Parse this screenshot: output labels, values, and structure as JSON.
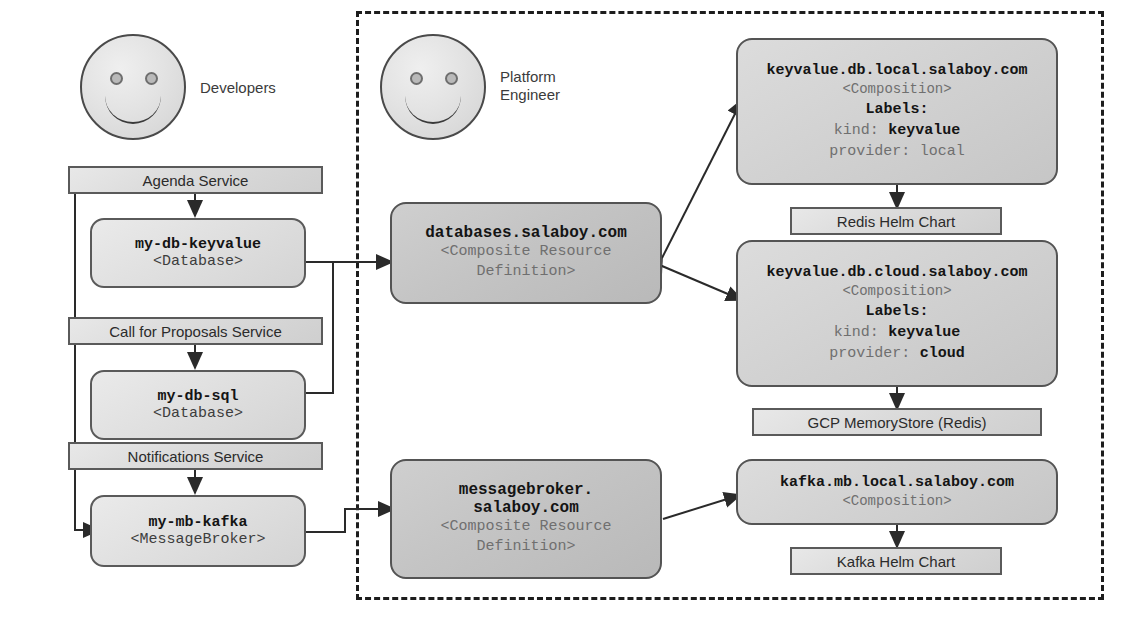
{
  "personas": [
    {
      "id": "developers",
      "label": "Developers"
    },
    {
      "id": "platform-engineer",
      "label": "Platform\nEngineer"
    }
  ],
  "developer_side": {
    "services": [
      {
        "id": "agenda-service",
        "label": "Agenda Service"
      },
      {
        "id": "call-for-proposals-service",
        "label": "Call for Proposals Service"
      },
      {
        "id": "notifications-service",
        "label": "Notifications Service"
      }
    ],
    "claims": [
      {
        "id": "my-db-keyvalue",
        "name": "my-db-keyvalue",
        "kind": "<Database>"
      },
      {
        "id": "my-db-sql",
        "name": "my-db-sql",
        "kind": "<Database>"
      },
      {
        "id": "my-mb-kafka",
        "name": "my-mb-kafka",
        "kind": "<MessageBroker>"
      }
    ]
  },
  "platform_side": {
    "xrds": [
      {
        "id": "databases-xrd",
        "name": "databases.salaboy.com",
        "kind_line1": "<Composite Resource",
        "kind_line2": "Definition>"
      },
      {
        "id": "messagebroker-xrd",
        "name_line1": "messagebroker.",
        "name_line2": "salaboy.com",
        "kind_line1": "<Composite Resource",
        "kind_line2": "Definition>"
      }
    ],
    "compositions": [
      {
        "id": "keyvalue-db-local",
        "name": "keyvalue.db.local.salaboy.com",
        "kind": "<Composition>",
        "labels_heading": "Labels:",
        "labels": [
          {
            "key": "kind:",
            "value": "keyvalue",
            "bold": true
          },
          {
            "key": "provider:",
            "value": "local",
            "bold": false
          }
        ]
      },
      {
        "id": "keyvalue-db-cloud",
        "name": "keyvalue.db.cloud.salaboy.com",
        "kind": "<Composition>",
        "labels_heading": "Labels:",
        "labels": [
          {
            "key": "kind:",
            "value": "keyvalue",
            "bold": true
          },
          {
            "key": "provider:",
            "value": "cloud",
            "bold": true
          }
        ]
      },
      {
        "id": "kafka-mb-local",
        "name": "kafka.mb.local.salaboy.com",
        "kind": "<Composition>"
      }
    ],
    "resources": [
      {
        "id": "redis-helm-chart",
        "label": "Redis Helm Chart"
      },
      {
        "id": "gcp-memorystore",
        "label": "GCP MemoryStore (Redis)"
      },
      {
        "id": "kafka-helm-chart",
        "label": "Kafka Helm Chart"
      }
    ]
  },
  "colors": {
    "stroke": "#545454",
    "line": "#2a2a2a",
    "boundary": "#1d1d1d",
    "text": "#2b2b2b",
    "muted": "#6f6f6f"
  }
}
